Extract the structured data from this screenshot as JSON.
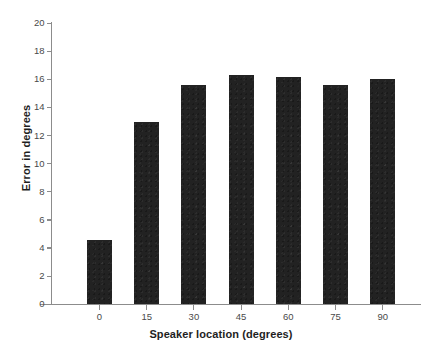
{
  "chart_data": {
    "type": "bar",
    "title": "",
    "subtitle": "",
    "xlabel": "Speaker location (degrees)",
    "ylabel": "Error in degrees",
    "categories": [
      "0",
      "15",
      "30",
      "45",
      "60",
      "75",
      "90"
    ],
    "values": [
      4.6,
      13.0,
      15.6,
      16.3,
      16.2,
      15.6,
      16.0
    ],
    "series": [
      {
        "name": "Error in degrees",
        "values": [
          4.6,
          13.0,
          15.6,
          16.3,
          16.2,
          15.6,
          16.0
        ]
      }
    ],
    "ylim": [
      0,
      20
    ],
    "ytick_labels": [
      "0",
      "2",
      "4",
      "6",
      "8",
      "10",
      "12",
      "14",
      "16",
      "18",
      "20"
    ],
    "ytick_values": [
      0,
      2,
      4,
      6,
      8,
      10,
      12,
      14,
      16,
      18,
      20
    ],
    "xtick_labels": [
      "0",
      "15",
      "30",
      "45",
      "60",
      "75",
      "90"
    ],
    "grid": false,
    "legend": false,
    "legend_position": "none",
    "bar_color": "#222222",
    "axis_color": "#8c8c8c",
    "tick_label_color": "#4a4a4a",
    "background_color": "#ffffff"
  }
}
